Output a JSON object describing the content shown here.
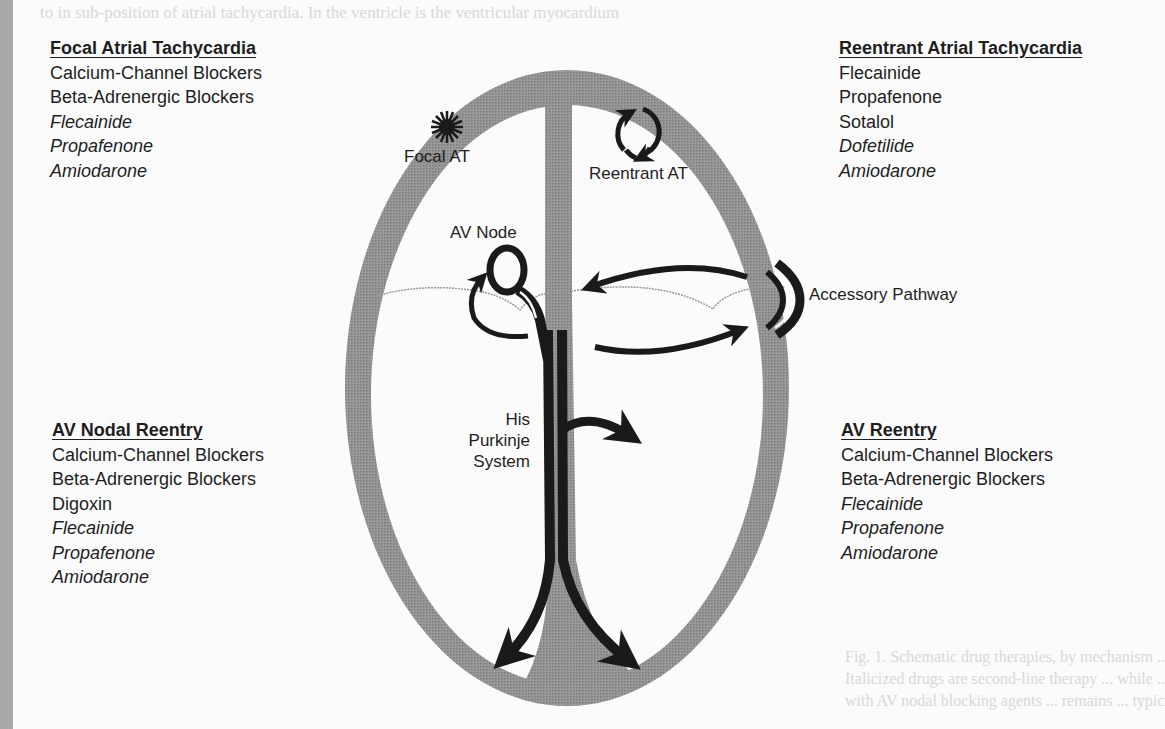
{
  "colors": {
    "wall": "#8c8c8c",
    "pathway": "#1a1a1a",
    "text": "#1e1e1e",
    "background": "#fbfbfb"
  },
  "diagram_labels": {
    "focal_at": "Focal AT",
    "reentrant_at": "Reentrant AT",
    "av_node": "AV Node",
    "accessory_pathway": "Accessory Pathway",
    "his_purkinje": [
      "His",
      "Purkinje",
      "System"
    ]
  },
  "drug_blocks": {
    "focal_atrial_tachycardia": {
      "title": "Focal Atrial Tachycardia",
      "items": [
        {
          "name": "Calcium-Channel Blockers",
          "italic": false
        },
        {
          "name": "Beta-Adrenergic Blockers",
          "italic": false
        },
        {
          "name": "Flecainide",
          "italic": true
        },
        {
          "name": "Propafenone",
          "italic": true
        },
        {
          "name": "Amiodarone",
          "italic": true
        }
      ]
    },
    "reentrant_atrial_tachycardia": {
      "title": "Reentrant Atrial Tachycardia",
      "items": [
        {
          "name": "Flecainide",
          "italic": false
        },
        {
          "name": "Propafenone",
          "italic": false
        },
        {
          "name": "Sotalol",
          "italic": false
        },
        {
          "name": "Dofetilide",
          "italic": true
        },
        {
          "name": "Amiodarone",
          "italic": true
        }
      ]
    },
    "av_nodal_reentry": {
      "title": "AV Nodal Reentry",
      "items": [
        {
          "name": "Calcium-Channel Blockers",
          "italic": false
        },
        {
          "name": "Beta-Adrenergic Blockers",
          "italic": false
        },
        {
          "name": "Digoxin",
          "italic": false
        },
        {
          "name": "Flecainide",
          "italic": true
        },
        {
          "name": "Propafenone",
          "italic": true
        },
        {
          "name": "Amiodarone",
          "italic": true
        }
      ]
    },
    "av_reentry": {
      "title": "AV Reentry",
      "items": [
        {
          "name": "Calcium-Channel Blockers",
          "italic": false
        },
        {
          "name": "Beta-Adrenergic Blockers",
          "italic": false
        },
        {
          "name": "Flecainide",
          "italic": true
        },
        {
          "name": "Propafenone",
          "italic": true
        },
        {
          "name": "Amiodarone",
          "italic": true
        }
      ]
    }
  },
  "background_text": {
    "top": "to in sub-position of atrial tachycardia. In the ventricle is the ventricular myocardium",
    "caption_lines": [
      "Fig. 1. Schematic drug therapies, by mechanism ... mechanism. Drugs for ... work best",
      "Italicized drugs are second-line therapy ... while ... where available ... primarily ...",
      "with AV nodal blocking agents ... remains ... typically ... reflected in their ... may"
    ]
  }
}
